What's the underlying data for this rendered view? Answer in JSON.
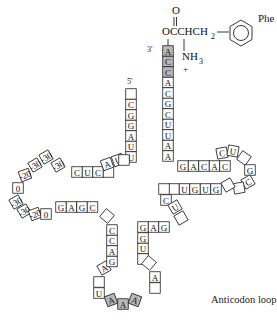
{
  "labels": {
    "amino_acid": "Phe",
    "three_prime": "3'",
    "five_prime": "5'",
    "anticodon_loop": "Anticodon loop",
    "chem_carbonyl_o": "O",
    "chem_ester": "OCCHCH",
    "chem_sub2": "2",
    "chem_nh3": "NH",
    "chem_sub3": "3",
    "chem_plus": "+"
  },
  "colors": {
    "shaded": "#b8b8b8",
    "stroke": "#222222"
  },
  "acceptor_3prime": [
    "A",
    "C",
    "C",
    "A",
    "C",
    "G",
    "C",
    "U",
    "U",
    "A",
    "A"
  ],
  "acceptor_5prime": [
    "",
    "C",
    "G",
    "G",
    "A",
    "U",
    "U"
  ],
  "d_arm_top": [
    "C",
    "U",
    "C",
    ""
  ],
  "d_arm_top_diag": [
    "A",
    "U"
  ],
  "d_loop": [
    "A",
    "G",
    "",
    "",
    "",
    "G",
    "G",
    "G",
    "A"
  ],
  "d_arm_bottom": [
    "G",
    "A",
    "G",
    "C"
  ],
  "anticodon_left": [
    "C",
    "C",
    "A",
    "G"
  ],
  "anticodon_loop_nt": [
    "A",
    "",
    "U",
    "A",
    "A",
    "A",
    "",
    "A",
    ""
  ],
  "anticodon_right": [
    "U",
    "G",
    "G",
    "A",
    "G"
  ],
  "variable": [
    "",
    "U"
  ],
  "t_arm_bottom": [
    "",
    "U",
    "G",
    "U",
    "G"
  ],
  "t_loop": [
    "",
    "",
    "C",
    "G",
    "",
    "U",
    "C"
  ],
  "t_arm_top": [
    "G",
    "A",
    "C",
    "A",
    "C"
  ]
}
